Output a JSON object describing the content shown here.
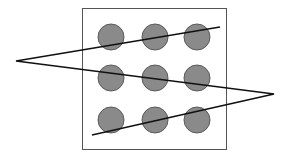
{
  "diagram": {
    "colors": {
      "background": "#ffffff",
      "box_stroke": "#555555",
      "dot_fill": "#8a8a8a",
      "dot_stroke": "#5a5a5a",
      "line": "#111111"
    },
    "box": {
      "x": 82,
      "y": 8,
      "width": 144,
      "height": 141
    },
    "dot_radius": 13,
    "dots": [
      {
        "cx": 111,
        "cy": 37
      },
      {
        "cx": 155,
        "cy": 37
      },
      {
        "cx": 197,
        "cy": 37
      },
      {
        "cx": 111,
        "cy": 78
      },
      {
        "cx": 155,
        "cy": 78
      },
      {
        "cx": 197,
        "cy": 78
      },
      {
        "cx": 111,
        "cy": 120
      },
      {
        "cx": 155,
        "cy": 120
      },
      {
        "cx": 197,
        "cy": 120
      }
    ],
    "path_points": [
      {
        "x": 220,
        "y": 27
      },
      {
        "x": 16,
        "y": 61
      },
      {
        "x": 274,
        "y": 94
      },
      {
        "x": 92,
        "y": 135
      }
    ]
  }
}
